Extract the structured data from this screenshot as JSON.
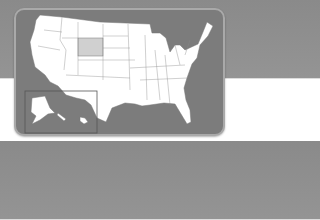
{
  "map": {
    "title": "United States",
    "highlighted_state": "Wyoming",
    "inset_labels": [
      "Alaska",
      "Hawaii"
    ],
    "colors": {
      "background_top": "#8a8a8a",
      "frame": "#7c7c7c",
      "states": "#ffffff",
      "highlight": "#d0d0d0",
      "border": "#777777"
    }
  }
}
